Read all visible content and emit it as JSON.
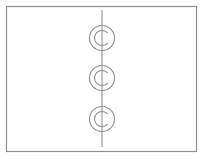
{
  "canvas": {
    "width": 206,
    "height": 159,
    "background_color": "#ffffff"
  },
  "frame": {
    "label": "diagram-border",
    "x": 6.5,
    "y": 6.5,
    "width": 190,
    "height": 145,
    "stroke_color": "#8e8e8e",
    "stroke_width": 1.2,
    "fill_color": "#ffffff"
  },
  "vertical_line": {
    "label": "center-vertical-line",
    "x": 102,
    "y_start": 10,
    "y_end": 147,
    "stroke_color": "#9a9a9a",
    "stroke_width": 1.2
  },
  "symbols": [
    {
      "name": "c-circle-symbol-top",
      "cx": 102,
      "cy": 38,
      "outer_radius": 12.5,
      "inner_radius": 7.5,
      "inner_arc_opening": "right",
      "stroke_color": "#8e8e8e",
      "stroke_width": 1.1
    },
    {
      "name": "c-circle-symbol-middle",
      "cx": 102,
      "cy": 78,
      "outer_radius": 12.5,
      "inner_radius": 7.5,
      "inner_arc_opening": "right",
      "stroke_color": "#8e8e8e",
      "stroke_width": 1.1
    },
    {
      "name": "c-circle-symbol-bottom",
      "cx": 102,
      "cy": 119,
      "outer_radius": 12.5,
      "inner_radius": 7.5,
      "inner_arc_opening": "right",
      "stroke_color": "#8e8e8e",
      "stroke_width": 1.1
    }
  ],
  "colors": {
    "stroke": "#8e8e8e",
    "line": "#9a9a9a",
    "background": "#ffffff"
  }
}
